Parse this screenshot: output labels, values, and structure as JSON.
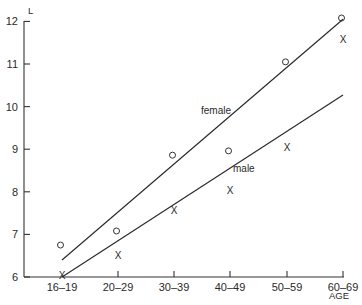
{
  "chart_data": {
    "type": "scatter",
    "title": "",
    "xlabel": "AGE",
    "ylabel": "L",
    "categories": [
      "16–19",
      "20–29",
      "30–39",
      "40–49",
      "50–59",
      "60–69"
    ],
    "ylim": [
      6,
      12
    ],
    "yticks": [
      "6",
      "7",
      "8",
      "9",
      "10",
      "11",
      "12"
    ],
    "grid": false,
    "legend": "inline labels on lines",
    "series": [
      {
        "name": "female",
        "marker": "circle",
        "values": [
          6.75,
          7.08,
          8.86,
          8.96,
          11.05,
          12.08
        ],
        "fit_line": {
          "start": 6.4,
          "end": 12.05
        }
      },
      {
        "name": "male",
        "marker": "x",
        "values": [
          6.05,
          6.52,
          7.57,
          8.04,
          9.05,
          11.59
        ],
        "fit_line": {
          "start": 6.0,
          "end": 10.27
        }
      }
    ]
  },
  "labels": {
    "ylabel": "L",
    "xlabel": "AGE",
    "female": "female",
    "male": "male",
    "x_marker": "X"
  }
}
